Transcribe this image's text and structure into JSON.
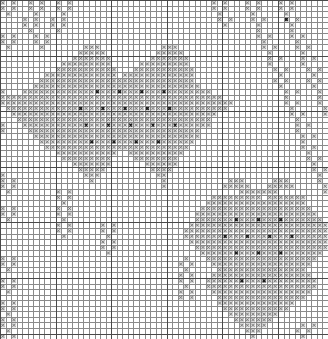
{
  "document": {
    "title": "Cross-Stitch Pattern Chart",
    "kind": "needlework-grid-chart",
    "description": "Monochrome counted cross-stitch / filet chart showing two eight-pointed star snowflake motifs joined by diagonal zigzag bands, with small corner and border motifs."
  },
  "grid": {
    "columns": 59,
    "rows": 61,
    "cell_width": 5.56,
    "cell_height": 5.56,
    "origin_x": 0,
    "origin_y": 0,
    "minor_line_color": "#8a8a8a",
    "major_line_color": "#4a4a4a",
    "major_line_every": 10,
    "minor_line_width": 1,
    "major_line_width": 1,
    "background_color": "#ffffff"
  },
  "legend": {
    "symbols": [
      {
        "key": "x",
        "name": "cross-symbol",
        "glyph": "×",
        "color": "#707070",
        "fill": "#d8d8d8",
        "label": "Main stitch"
      },
      {
        "key": "d",
        "name": "dark-symbol",
        "glyph": "×",
        "color": "#1a1a1a",
        "fill": "#c4c4c4",
        "label": "Accent stitch"
      }
    ]
  },
  "chart_data": {
    "type": "heatmap",
    "xlabel": "",
    "ylabel": "",
    "grid": true,
    "legend_position": "none",
    "columns": 59,
    "rows": 61,
    "cell_values": [
      ".",
      "x",
      "d"
    ],
    "rows_data": [
      "x.x..x.x..x.x.........................x.x...x.x...x.x.......x",
      "x.x..x.x..x.x.........................x.x...x.x...x.x.......x",
      ".x....x....x...........................x.....x.....x........d",
      "....x.x..x.x...........................x.x...x.x...d.x.......",
      "....x.x..x.x............................x.....x.....x........",
      ".....x....x...................................x.....x.......x",
      "x.x...x.x.....................................x.x...x.x.....x",
      "x.x...x.x......................................x.....x.......",
      ".x.....x.......xxx...........xxx...............x.x...x.x....x",
      "..............xxxxx.........xxxxx...............x.....x.....x",
      ".............xxxxxxx.......xxxxxxx..............x.x...x.x....",
      "...........xxxxxxxxx.....xxxxxxxxx..............x.....x......",
      "..........xxxxxxxxxxx...xxxxxxxxxxx..............x.x...x.x...",
      "........xxxxxxxxxxxxx.xxxxxxxxxxxxx...............x.....x....",
      ".......xxxxxxxxxxxxxxxxxxxxxxxxxxxx..............x.x...x.x...",
      "......xxxxxxxxxxxxxxxxxxxxxxxxxxxxxx..............x.....x....",
      "x...xxxxxxxxxxxxxdxxxdxxxdxxxdxxxxxxxx.............x.x...x.x.",
      "xxxxxxxxxxxxxxxxxxxxxxxxxxxxxxxxxxxxxxxx...........x.....x...",
      "xxxxxxxxxxxxxxxxxxxxxxxxxxxxxxxxxxxxxxxxxx.........x.x...x.x.",
      ".xxxxxxxxxxxxxdxxxdxxxdxxxdxxxdxxxxxxxxxx...........x.....x..",
      "..xxxxxxxxxxxxxxxxxxxxxxxxxxxxxxxxxxxxx.............x.x...x.x",
      "...xxxxxxxxxxxxxxxxxxxxxxxxxxxxxxxxxxx...............x.....x.",
      "x...xxxxxxxxxxxdxxxdxxxdxxxdxxxdxxxxxx...............x.x...x.",
      "x....xxxxxxxxxxxxxxxxxxxxxxxxxxxxxxx.................x.....x.",
      "......xxxxxxxxxxxxxxxxxxxxxxxxxxxxxx..................x.x...x",
      ".......xxxxxxxxxdxxxdxxxdxxxdxxxxxx...................x.....x",
      "........xxxxxxxxxxxxxxxxxxxxxxxxxx....................x.x...x",
      "..........xxxxxxxxxxx..xxxxxxxxxx......................x.....",
      "...........xxxxxxxxx....xxxxxxxx.......................x.x...",
      ".............xxxxxxx......xxxxxx........................x....",
      "..............xxxxx........xxxx.........................x.x..",
      "x..............xxx..........xx...........................x...",
      "x.x.............x............x...........xxx.....xxx.....x.x.",
      "x.x..........................x..........xxxxx...xxxxx.....x..",
      ".x........x.x..............................xxxxxxx........x.x",
      "..........x.x.........................xxxxxxxxx.xxxxxxx....x.",
      "...........x.........................xxxxxxxxxxxxxxxxxx....x.",
      "x.x.......x.x.......................xxxxxxxxxxxxxxxxxxxx.....",
      "x.x.......x.x......................xxxxxxxxxxxxxxxxxxxxxx....",
      ".x.........x.......................xxxxxxxdxxxdxxxdxxxxxxx...",
      "..........x.x.....x.x.............xxxxxxxxxxxxxxxxxxxxxxxxx..",
      "..........x.x.....x.x............xxxxxxxxxxxxxxxxxxxxxxxxxxx.",
      "...........x.......x.............xxxxxxxdxxxdxxxdxxxdxxxxxxxx",
      "..................x.x.............xxxxxxxxxxxxxxxxxxxxxxxxxx.",
      "..................x.x..............xxxxxxxxxxxxxxxxxxxxxxxx..",
      "...................x................xxxxxxdxxxdxxxdxxxxxxx...",
      "x.x..............................x...xxxxxxxxxxxxxxxxxxxx...",
      "x.x.............................x.x...xxxxxxxxxxxxxxxxxx....",
      ".x...............................x.....xxxxxxxxxxxxxxxx.....",
      "................................x.x...xxxxxxxxxxxxxxxxxx....",
      "x.x.............................x.x..xxxxxxdxxxdxxxxxxxxx...",
      "x.x..............................x...xxxxxxxxxxxxxxxxxxxx...",
      ".x..............................x.x...xxxxxxxxxxxxxxxxxx....",
      "................................x.x....xxxxxxxxxxxxxxxx.....",
      "x.x....................................xxxxxxxxxxxxxx.......",
      "x.x.....................................xxxxxxxxxxxx........",
      ".x.......................................xxxxxxxxx..........",
      "x.x.......................................xxxxxxx...........",
      "x.x........................................xxxxx......x.x..x",
      ".x..........................................xxx......x.x...x",
      "x.x..........................................x........x....x"
    ]
  }
}
